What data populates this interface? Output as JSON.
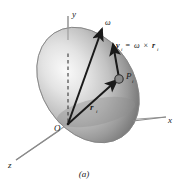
{
  "figure": {
    "caption": "(a)",
    "background_color": "#ffffff",
    "ink_color": "#1a1a1a",
    "body_fill_light": "#f2f2f2",
    "body_fill_mid": "#b8b8b8",
    "body_fill_dark": "#6e6e6e",
    "axis_color": "#8a8a8a"
  },
  "axes": {
    "x_label": "x",
    "y_label": "y",
    "z_label": "z",
    "origin_label": "O"
  },
  "vectors": {
    "omega_label": "ω",
    "position_label": "r",
    "position_sub": "i",
    "velocity_label": "v",
    "velocity_sub": "i",
    "point_label": "P",
    "point_sub": "i",
    "equation": {
      "lhs": "v",
      "lhs_sub": "i",
      "equals": "=",
      "omega": "ω",
      "cross": "×",
      "rhs": "r",
      "rhs_sub": "i"
    }
  }
}
